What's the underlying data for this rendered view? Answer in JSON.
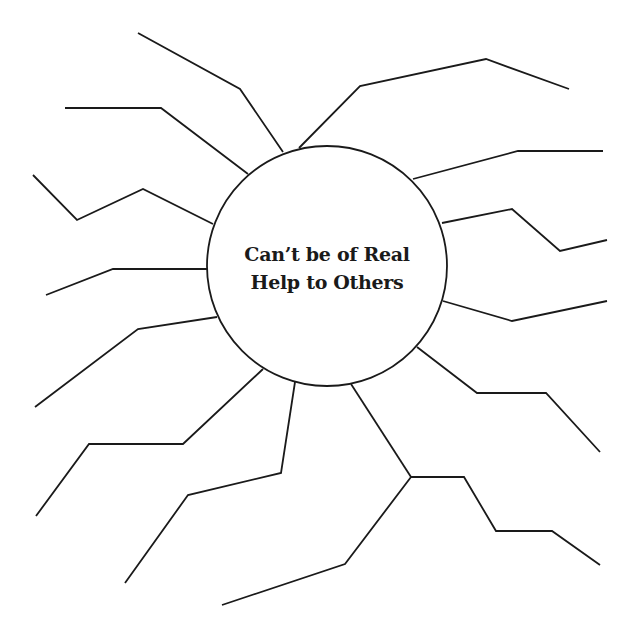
{
  "diagram": {
    "type": "spider-map",
    "center": {
      "label_lines": [
        "Can’t be of Real",
        "Help to Others"
      ],
      "cx": 327,
      "cy": 266,
      "r": 120
    },
    "stroke_color": "#1a1a1a",
    "background": "#ffffff",
    "legs": [
      {
        "name": "leg-upper-left-1",
        "points": "283,152 240,89 138,33"
      },
      {
        "name": "leg-upper-left-2",
        "points": "248,174 161,108 65,108"
      },
      {
        "name": "leg-left-1",
        "points": "213,224 143,189 77,220 33,175"
      },
      {
        "name": "leg-left-2",
        "points": "207,269 113,269 46,295"
      },
      {
        "name": "leg-lower-left-1",
        "points": "217,317 138,329 35,407"
      },
      {
        "name": "leg-lower-left-2",
        "points": "263,369 183,444 89,444 36,516"
      },
      {
        "name": "leg-bottom-left",
        "points": "295,382 281,473 188,495 125,583"
      },
      {
        "name": "leg-bottom-stem",
        "points": "351,384 411,477"
      },
      {
        "name": "leg-bottom-branch-left",
        "points": "411,477 345,564 222,605"
      },
      {
        "name": "leg-bottom-branch-right",
        "points": "411,477 464,477 496,531 552,531 600,565"
      },
      {
        "name": "leg-lower-right",
        "points": "417,347 477,393 546,393 600,452"
      },
      {
        "name": "leg-right-1",
        "points": "443,301 512,321 607,301"
      },
      {
        "name": "leg-right-2",
        "points": "442,223 512,209 560,251 607,240"
      },
      {
        "name": "leg-upper-right-1",
        "points": "413,179 518,151 603,151"
      },
      {
        "name": "leg-upper-right-2",
        "points": "299,148 360,86 486,59 569,89"
      }
    ]
  }
}
